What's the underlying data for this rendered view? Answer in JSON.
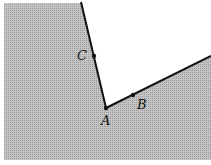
{
  "diagram": {
    "points": {
      "A": {
        "label": "A",
        "x": 106,
        "y": 108
      },
      "B": {
        "label": "B",
        "x": 133,
        "y": 95
      },
      "C": {
        "label": "C",
        "x": 94,
        "y": 56
      }
    },
    "colors": {
      "shade": "#b5b5b5",
      "line": "#111111",
      "background": "#ffffff"
    }
  }
}
